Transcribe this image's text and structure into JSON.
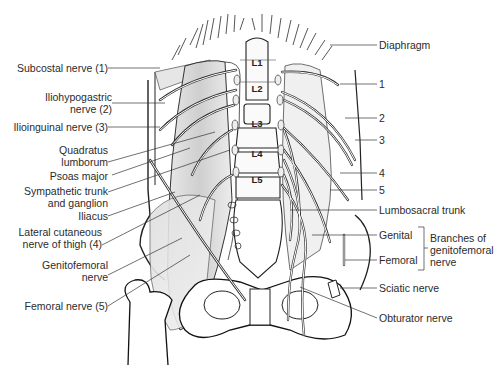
{
  "figure": {
    "vertebrae": [
      "L1",
      "L2",
      "L3",
      "L4",
      "L5"
    ],
    "left_labels": [
      {
        "id": "subcostal",
        "lines": [
          "Subcostal nerve (1)"
        ]
      },
      {
        "id": "iliohypogastric",
        "lines": [
          "Iliohypogastric",
          "nerve (2)"
        ]
      },
      {
        "id": "ilioinguinal",
        "lines": [
          "Ilioinguinal nerve (3)"
        ]
      },
      {
        "id": "quadratus",
        "lines": [
          "Quadratus",
          "lumborum"
        ]
      },
      {
        "id": "psoas",
        "lines": [
          "Psoas major"
        ]
      },
      {
        "id": "sympathetic",
        "lines": [
          "Sympathetic trunk",
          "and ganglion"
        ]
      },
      {
        "id": "iliacus",
        "lines": [
          "Iliacus"
        ]
      },
      {
        "id": "lateral-cutaneous",
        "lines": [
          "Lateral cutaneous",
          "nerve of thigh (4)"
        ]
      },
      {
        "id": "genitofemoral",
        "lines": [
          "Genitofemoral",
          "nerve"
        ]
      },
      {
        "id": "femoral",
        "lines": [
          "Femoral nerve (5)"
        ]
      }
    ],
    "right_labels": [
      {
        "id": "diaphragm",
        "text": "Diaphragm"
      },
      {
        "id": "n1",
        "text": "1"
      },
      {
        "id": "n2",
        "text": "2"
      },
      {
        "id": "n3",
        "text": "3"
      },
      {
        "id": "n4",
        "text": "4"
      },
      {
        "id": "n5",
        "text": "5"
      },
      {
        "id": "lumbosacral",
        "text": "Lumbosacral trunk"
      },
      {
        "id": "genital",
        "text": "Genital"
      },
      {
        "id": "femoral-branch",
        "text": "Femoral"
      },
      {
        "id": "sciatic",
        "text": "Sciatic nerve"
      },
      {
        "id": "obturator",
        "text": "Obturator nerve"
      }
    ],
    "bracket_label": [
      "Branches of",
      "genitofemoral",
      "nerve"
    ]
  }
}
